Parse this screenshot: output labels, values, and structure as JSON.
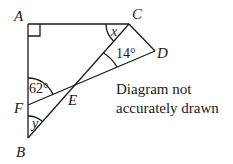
{
  "diagram": {
    "points": {
      "A": {
        "label": "A",
        "x": 28,
        "y": 24
      },
      "C": {
        "label": "C",
        "x": 129,
        "y": 24
      },
      "D": {
        "label": "D",
        "x": 155,
        "y": 51
      },
      "E": {
        "label": "E",
        "x": 75,
        "y": 85
      },
      "F": {
        "label": "F",
        "x": 28,
        "y": 105
      },
      "B": {
        "label": "B",
        "x": 28,
        "y": 138
      }
    },
    "angles": {
      "x": "x",
      "fourteen": "14°",
      "sixtytwo": "62°",
      "y": "y"
    },
    "note_line1": "Diagram not",
    "note_line2": "accurately drawn",
    "stroke_color": "#1a1a1a"
  }
}
